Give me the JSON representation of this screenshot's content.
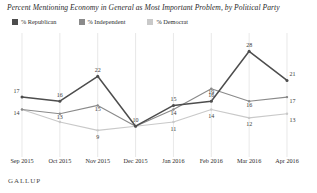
{
  "chart_title": "Percent Mentioning Economy in General as Most Important Problem, by Political Party",
  "footer": {
    "brand": "GALLUP"
  },
  "legend": {
    "position": "top-left",
    "items": [
      {
        "label": "% Republican",
        "color": "#4d4d4d"
      },
      {
        "label": "% Independent",
        "color": "#8a8a8a"
      },
      {
        "label": "% Democrat",
        "color": "#c9c9c9"
      }
    ]
  },
  "chart_data": {
    "type": "line",
    "title": "Percent Mentioning Economy in General as Most Important Problem, by Political Party",
    "xlabel": "",
    "ylabel": "",
    "ylim": [
      5,
      30
    ],
    "grid": "vertical",
    "legend_position": "top-left",
    "categories": [
      "Sep 2015",
      "Oct 2015",
      "Nov 2015",
      "Dec 2015",
      "Jan 2016",
      "Feb 2016",
      "Mar 2016",
      "Apr 2016"
    ],
    "series": [
      {
        "name": "% Republican",
        "color": "#4d4d4d",
        "values": [
          17,
          16,
          22,
          10,
          15,
          16,
          28,
          21
        ]
      },
      {
        "name": "% Independent",
        "color": "#8a8a8a",
        "values": [
          14,
          13,
          15,
          10,
          14,
          19,
          16,
          17
        ]
      },
      {
        "name": "% Democrat",
        "color": "#c9c9c9",
        "values": [
          14,
          11,
          9,
          10,
          11,
          14,
          12,
          13
        ]
      }
    ],
    "data_labels": {
      "% Republican": [
        "17",
        "16",
        "22",
        "10",
        "15",
        "16",
        "28",
        "21"
      ],
      "% Independent": [
        "14",
        "13",
        "15",
        "",
        "14",
        "19",
        "16",
        "17"
      ],
      "% Democrat": [
        "",
        "",
        "9",
        "",
        "11",
        "14",
        "12",
        "13"
      ]
    }
  }
}
